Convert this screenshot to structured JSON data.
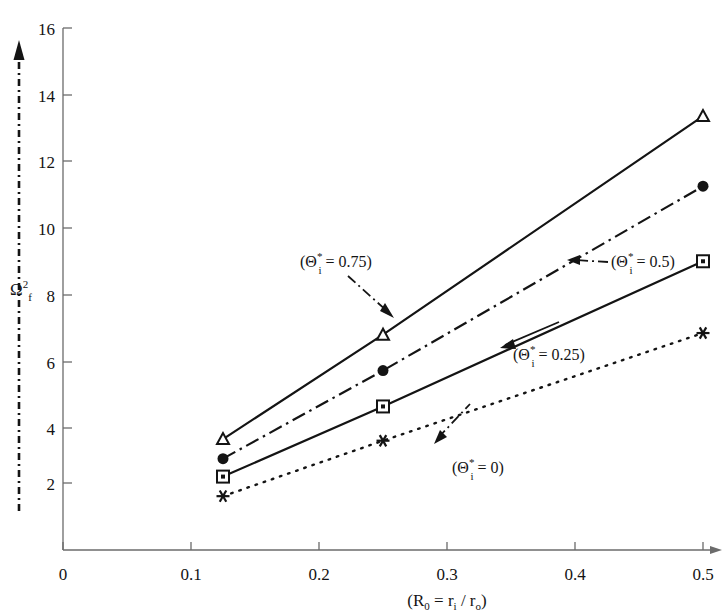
{
  "chart_data": {
    "type": "line",
    "title": "",
    "xlabel": "(R₀ = rᵢ / rₒ)",
    "ylabel": "Ω²ғ",
    "ylabel_parts": {
      "base": "Ω",
      "sup": "2",
      "sub": "f"
    },
    "xlim": [
      0,
      0.5
    ],
    "ylim": [
      0,
      16
    ],
    "xticks": [
      "0",
      "0.1",
      "0.2",
      "0.3",
      "0.4",
      "0.5"
    ],
    "xtick_values": [
      0,
      0.1,
      0.2,
      0.3,
      0.4,
      0.5
    ],
    "yticks": [
      "2",
      "4",
      "6",
      "8",
      "10",
      "12",
      "14",
      "16"
    ],
    "ytick_values": [
      2,
      4,
      6,
      8,
      10,
      12,
      14,
      16
    ],
    "grid": false,
    "legend": "annotations-on-plot",
    "x": [
      0.125,
      0.25,
      0.5
    ],
    "series": [
      {
        "name": "(Θ*ᵢ = 0.75)",
        "marker": "triangle",
        "line": "solid",
        "values": [
          3.4,
          6.6,
          13.3
        ]
      },
      {
        "name": "(Θ*ᵢ = 0.5)",
        "marker": "filled-circle",
        "line": "dash-dot",
        "values": [
          2.8,
          5.5,
          11.15
        ]
      },
      {
        "name": "(Θ*ᵢ = 0.25)",
        "marker": "square",
        "line": "solid",
        "values": [
          2.25,
          4.4,
          8.85
        ]
      },
      {
        "name": "(Θ*ᵢ = 0)",
        "marker": "asterisk",
        "line": "dotted",
        "values": [
          1.65,
          3.35,
          6.65
        ]
      }
    ],
    "annotations": [
      {
        "id": "ann-075",
        "text": "(Θᵢ* = 0.75)",
        "label_x": 300,
        "label_y": 267,
        "series": 0
      },
      {
        "id": "ann-05",
        "text": "(Θᵢ* = 0.5)",
        "label_x": 611,
        "label_y": 267,
        "series": 1
      },
      {
        "id": "ann-025",
        "text": "(Θᵢ* = 0.25)",
        "label_x": 513,
        "label_y": 360,
        "series": 2
      },
      {
        "id": "ann-0",
        "text": "(Θᵢ* = 0)",
        "label_x": 452,
        "label_y": 473,
        "series": 3
      }
    ],
    "annotation_text_parts": [
      {
        "open": "(",
        "theta": "Θ",
        "sup": "*",
        "sub": "i",
        "eq": " = 0.75)"
      },
      {
        "open": "(",
        "theta": "Θ",
        "sup": "*",
        "sub": "i",
        "eq": " = 0.5)"
      },
      {
        "open": "(",
        "theta": "Θ",
        "sup": "*",
        "sub": "i",
        "eq": " = 0.25)"
      },
      {
        "open": "(",
        "theta": "Θ",
        "sup": "*",
        "sub": "i",
        "eq": " = 0)"
      }
    ],
    "colors": {
      "ink": "#141414",
      "axis": "#555555",
      "background": "#ffffff"
    }
  },
  "axis": {
    "x_title_open": "(R",
    "x_title_sub0": "0",
    "x_title_eq": " = r",
    "x_title_subi": "i",
    "x_title_slash": " / r",
    "x_title_subo": "o",
    "x_title_close": ")"
  }
}
